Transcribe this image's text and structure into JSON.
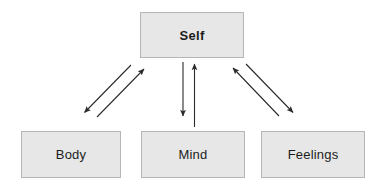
{
  "diagram": {
    "background_color": "#ffffff",
    "node_fill_color": "#e7e7e7",
    "node_border_color": "#b6b6b6",
    "node_text_color": "#1c1c1c",
    "arrow_color": "#2b2b2b",
    "nodes": [
      {
        "id": "self",
        "label": "Self",
        "emphasis": "bold",
        "x": 140,
        "y": 12,
        "w": 104,
        "h": 46
      },
      {
        "id": "body",
        "label": "Body",
        "emphasis": "regular",
        "x": 21,
        "y": 131,
        "w": 100,
        "h": 47
      },
      {
        "id": "mind",
        "label": "Mind",
        "emphasis": "regular",
        "x": 141,
        "y": 131,
        "w": 104,
        "h": 47
      },
      {
        "id": "feelings",
        "label": "Feelings",
        "emphasis": "regular",
        "x": 261,
        "y": 131,
        "w": 104,
        "h": 47
      }
    ],
    "connectors": [
      {
        "id": "self-to-body",
        "from": "self",
        "to": "body",
        "direction": "down-left",
        "style": "single-arrow"
      },
      {
        "id": "body-to-self",
        "from": "body",
        "to": "self",
        "direction": "up-right",
        "style": "single-arrow"
      },
      {
        "id": "self-to-mind",
        "from": "self",
        "to": "mind",
        "direction": "down",
        "style": "single-arrow"
      },
      {
        "id": "mind-to-self",
        "from": "mind",
        "to": "self",
        "direction": "up",
        "style": "single-arrow"
      },
      {
        "id": "self-to-feelings",
        "from": "self",
        "to": "feelings",
        "direction": "down-right",
        "style": "single-arrow"
      },
      {
        "id": "feelings-to-self",
        "from": "feelings",
        "to": "self",
        "direction": "up-left",
        "style": "single-arrow"
      }
    ]
  }
}
